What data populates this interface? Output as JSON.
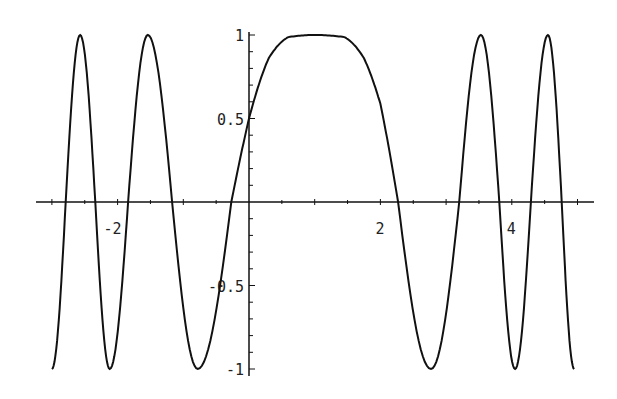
{
  "chart_data": {
    "type": "line",
    "title": "",
    "xlabel": "",
    "ylabel": "",
    "xlim": [
      -3.0,
      5.2
    ],
    "ylim": [
      -1,
      1
    ],
    "grid": false,
    "legend": null,
    "x_tick_labels": [
      {
        "value": -2,
        "label": "-2"
      },
      {
        "value": 2,
        "label": "2"
      },
      {
        "value": 4,
        "label": "4"
      }
    ],
    "y_tick_labels": [
      {
        "value": 1,
        "label": "1"
      },
      {
        "value": 0.5,
        "label": "0.5"
      },
      {
        "value": -0.5,
        "label": "-0.5"
      },
      {
        "value": -1,
        "label": "-1"
      }
    ],
    "x_minor_tick_step": 0.5,
    "y_minor_tick_step": 0.1,
    "series": [
      {
        "name": "f(x)",
        "color": "#111111",
        "description": "y = sin(theta(x)); theta interpolated through landmark phases (in units of pi)",
        "phase_landmarks": [
          {
            "x": -3.0,
            "theta_pi": -4.5
          },
          {
            "x": -2.79,
            "theta_pi": -4.0
          },
          {
            "x": -2.57,
            "theta_pi": -3.5
          },
          {
            "x": -2.34,
            "theta_pi": -3.0
          },
          {
            "x": -2.12,
            "theta_pi": -2.5
          },
          {
            "x": -1.84,
            "theta_pi": -2.0
          },
          {
            "x": -1.54,
            "theta_pi": -1.5
          },
          {
            "x": -1.17,
            "theta_pi": -1.0
          },
          {
            "x": -0.78,
            "theta_pi": -0.5
          },
          {
            "x": -0.27,
            "theta_pi": 0.0
          },
          {
            "x": 0.0,
            "theta_pi": 0.1667
          },
          {
            "x": 0.3,
            "theta_pi": 0.33
          },
          {
            "x": 0.6,
            "theta_pi": 0.45
          },
          {
            "x": 1.0,
            "theta_pi": 0.5
          },
          {
            "x": 1.45,
            "theta_pi": 0.55
          },
          {
            "x": 1.75,
            "theta_pi": 0.67
          },
          {
            "x": 2.0,
            "theta_pi": 0.8
          },
          {
            "x": 2.27,
            "theta_pi": 1.0
          },
          {
            "x": 2.77,
            "theta_pi": 1.5
          },
          {
            "x": 3.2,
            "theta_pi": 2.0
          },
          {
            "x": 3.53,
            "theta_pi": 2.5
          },
          {
            "x": 3.81,
            "theta_pi": 3.0
          },
          {
            "x": 4.05,
            "theta_pi": 3.5
          },
          {
            "x": 4.29,
            "theta_pi": 4.0
          },
          {
            "x": 4.55,
            "theta_pi": 4.5
          },
          {
            "x": 4.76,
            "theta_pi": 5.0
          },
          {
            "x": 4.95,
            "theta_pi": 5.5
          }
        ],
        "key_points": [
          {
            "x": -3.0,
            "y": -1
          },
          {
            "x": -2.57,
            "y": 1
          },
          {
            "x": -2.12,
            "y": -1
          },
          {
            "x": -1.54,
            "y": 1
          },
          {
            "x": -0.78,
            "y": -1
          },
          {
            "x": 0.0,
            "y": 0.5
          },
          {
            "x": 1.0,
            "y": 1
          },
          {
            "x": 2.77,
            "y": -1
          },
          {
            "x": 3.53,
            "y": 1
          },
          {
            "x": 4.05,
            "y": -1
          },
          {
            "x": 4.55,
            "y": 1
          },
          {
            "x": 4.95,
            "y": -1
          }
        ]
      }
    ]
  }
}
